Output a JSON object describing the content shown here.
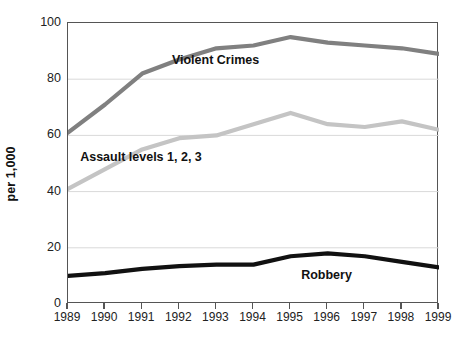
{
  "chart_data": {
    "type": "line",
    "title": "",
    "subtitle": "",
    "xlabel": "",
    "ylabel": "per 1,000",
    "categories": [
      "1989",
      "1990",
      "1991",
      "1992",
      "1993",
      "1994",
      "1995",
      "1996",
      "1997",
      "1998",
      "1999"
    ],
    "x": [
      1989,
      1990,
      1991,
      1992,
      1993,
      1994,
      1995,
      1996,
      1997,
      1998,
      1999
    ],
    "xlim": [
      1989,
      1999
    ],
    "ylim": [
      0,
      100
    ],
    "yticks": [
      0,
      20,
      40,
      60,
      80,
      100
    ],
    "ytick_labels": [
      "0",
      "20",
      "40",
      "60",
      "80",
      "100"
    ],
    "grid": "horizontal",
    "grid_color": "#d9d9d9",
    "legend": "inline-labels",
    "series": [
      {
        "name": "Violent Crimes",
        "color": "#808080",
        "width": 4.2,
        "values": [
          61,
          71,
          82,
          87,
          91,
          92,
          95,
          93,
          92,
          91,
          89
        ],
        "label_x": 1993.0,
        "label_y": 86.5
      },
      {
        "name": "Assault levels 1, 2, 3",
        "color": "#c4c4c4",
        "width": 4.2,
        "values": [
          41,
          48,
          55,
          59,
          60,
          64,
          68,
          64,
          63,
          65,
          62
        ],
        "label_x": 1991.0,
        "label_y": 52.0
      },
      {
        "name": "Robbery",
        "color": "#111111",
        "width": 4.2,
        "values": [
          10,
          11,
          12.5,
          13.5,
          14,
          14,
          17,
          18,
          17,
          15,
          13
        ],
        "label_x": 1996.0,
        "label_y": 10.0
      }
    ]
  }
}
